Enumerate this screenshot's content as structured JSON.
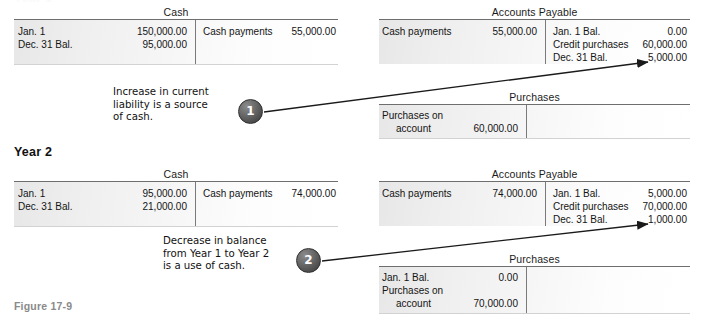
{
  "figure": {
    "clipped_top_label": "Year 1",
    "caption": "Figure 17-9",
    "year2_heading": "Year 2"
  },
  "accounts": {
    "year1_cash": {
      "title": "Cash",
      "debit_rows": [
        {
          "label": "Jan. 1",
          "amount": "150,000.00"
        },
        {
          "label": "Dec. 31 Bal.",
          "amount": "95,000.00"
        }
      ],
      "credit_rows": [
        {
          "label": "Cash payments",
          "amount": "55,000.00"
        }
      ]
    },
    "year1_accounts_payable": {
      "title": "Accounts Payable",
      "debit_rows": [
        {
          "label": "Cash payments",
          "amount": "55,000.00"
        }
      ],
      "credit_rows": [
        {
          "label": "Jan. 1 Bal.",
          "amount": "0.00"
        },
        {
          "label": "Credit purchases",
          "amount": "60,000.00"
        },
        {
          "label": "Dec. 31 Bal.",
          "amount": "5,000.00"
        }
      ]
    },
    "year1_purchases": {
      "title": "Purchases",
      "debit_rows": [
        {
          "label": "Purchases on",
          "amount": ""
        },
        {
          "label": "account",
          "amount": "60,000.00"
        }
      ],
      "credit_rows": []
    },
    "year2_cash": {
      "title": "Cash",
      "debit_rows": [
        {
          "label": "Jan. 1",
          "amount": "95,000.00"
        },
        {
          "label": "Dec. 31 Bal.",
          "amount": "21,000.00"
        }
      ],
      "credit_rows": [
        {
          "label": "Cash payments",
          "amount": "74,000.00"
        }
      ]
    },
    "year2_accounts_payable": {
      "title": "Accounts Payable",
      "debit_rows": [
        {
          "label": "Cash payments",
          "amount": "74,000.00"
        }
      ],
      "credit_rows": [
        {
          "label": "Jan. 1 Bal.",
          "amount": "5,000.00"
        },
        {
          "label": "Credit purchases",
          "amount": "70,000.00"
        },
        {
          "label": "Dec. 31 Bal.",
          "amount": "1,000.00"
        }
      ]
    },
    "year2_purchases": {
      "title": "Purchases",
      "debit_rows": [
        {
          "label": "Jan. 1 Bal.",
          "amount": "0.00"
        },
        {
          "label": "Purchases on",
          "amount": ""
        },
        {
          "label": "account",
          "amount": "70,000.00"
        }
      ],
      "credit_rows": []
    }
  },
  "annotations": [
    {
      "badge": "1",
      "line1": "Increase in current",
      "line2": "liability is a source",
      "line3": "of cash."
    },
    {
      "badge": "2",
      "line1": "Decrease in balance",
      "line2": "from Year 1 to Year 2",
      "line3": "is a use of cash."
    }
  ],
  "colors": {
    "rule": "#6e6e6e",
    "badge_fill": "#4e4e4e",
    "caption": "#8a8a8a",
    "text": "#141414"
  }
}
